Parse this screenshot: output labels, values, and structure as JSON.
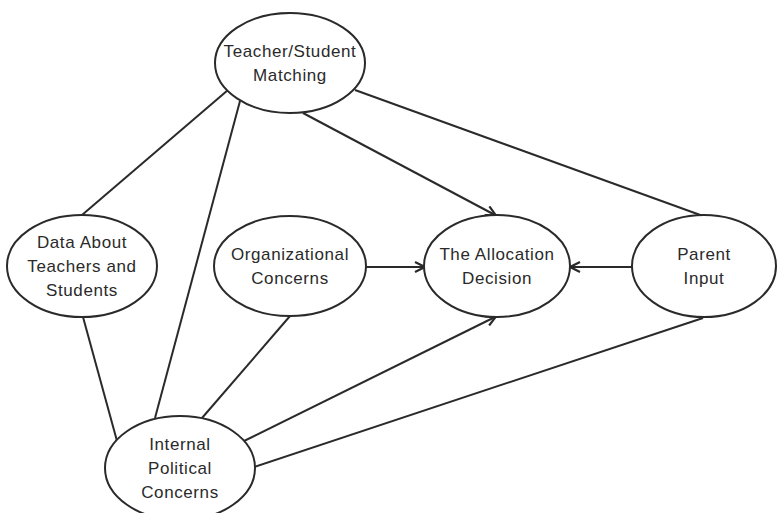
{
  "diagram": {
    "type": "concept-map",
    "stroke_color": "#2a2a2a",
    "background_color": "#ffffff",
    "nodes": [
      {
        "id": "teacher-student-matching",
        "lines": [
          "Teacher/Student",
          "Matching"
        ],
        "cx": 290,
        "cy": 63,
        "rx": 75,
        "ry": 50
      },
      {
        "id": "data-about-teachers-students",
        "lines": [
          "Data About",
          "Teachers and",
          "Students"
        ],
        "cx": 82,
        "cy": 266,
        "rx": 75,
        "ry": 51
      },
      {
        "id": "organizational-concerns",
        "lines": [
          "Organizational",
          "Concerns"
        ],
        "cx": 290,
        "cy": 266,
        "rx": 76,
        "ry": 50
      },
      {
        "id": "allocation-decision",
        "lines": [
          "The  Allocation",
          "Decision"
        ],
        "cx": 497,
        "cy": 266,
        "rx": 73,
        "ry": 51
      },
      {
        "id": "parent-input",
        "lines": [
          "Parent",
          "Input"
        ],
        "cx": 704,
        "cy": 266,
        "rx": 72,
        "ry": 51
      },
      {
        "id": "internal-political-concerns",
        "lines": [
          "Internal",
          "Political",
          "Concerns"
        ],
        "cx": 180,
        "cy": 468,
        "rx": 75,
        "ry": 52
      }
    ],
    "edges": [
      {
        "from": "teacher-student-matching",
        "to": "data-about-teachers-students",
        "arrow": false,
        "x1": 228,
        "y1": 90,
        "x2": 82,
        "y2": 215
      },
      {
        "from": "teacher-student-matching",
        "to": "internal-political-concerns",
        "arrow": false,
        "x1": 240,
        "y1": 101,
        "x2": 155,
        "y2": 418
      },
      {
        "from": "teacher-student-matching",
        "to": "allocation-decision",
        "arrow": true,
        "x1": 303,
        "y1": 113,
        "x2": 495,
        "y2": 215
      },
      {
        "from": "teacher-student-matching",
        "to": "parent-input",
        "arrow": false,
        "x1": 355,
        "y1": 90,
        "x2": 703,
        "y2": 216
      },
      {
        "from": "data-about-teachers-students",
        "to": "internal-political-concerns",
        "arrow": false,
        "x1": 83,
        "y1": 317,
        "x2": 117,
        "y2": 441
      },
      {
        "from": "organizational-concerns",
        "to": "allocation-decision",
        "arrow": true,
        "x1": 366,
        "y1": 267,
        "x2": 424,
        "y2": 267
      },
      {
        "from": "organizational-concerns",
        "to": "internal-political-concerns",
        "arrow": false,
        "x1": 290,
        "y1": 316,
        "x2": 202,
        "y2": 418
      },
      {
        "from": "parent-input",
        "to": "allocation-decision",
        "arrow": true,
        "x1": 632,
        "y1": 267,
        "x2": 571,
        "y2": 267
      },
      {
        "from": "internal-political-concerns",
        "to": "allocation-decision",
        "arrow": true,
        "x1": 242,
        "y1": 442,
        "x2": 495,
        "y2": 317
      },
      {
        "from": "internal-political-concerns",
        "to": "parent-input",
        "arrow": false,
        "x1": 254,
        "y1": 467,
        "x2": 703,
        "y2": 318
      }
    ]
  }
}
